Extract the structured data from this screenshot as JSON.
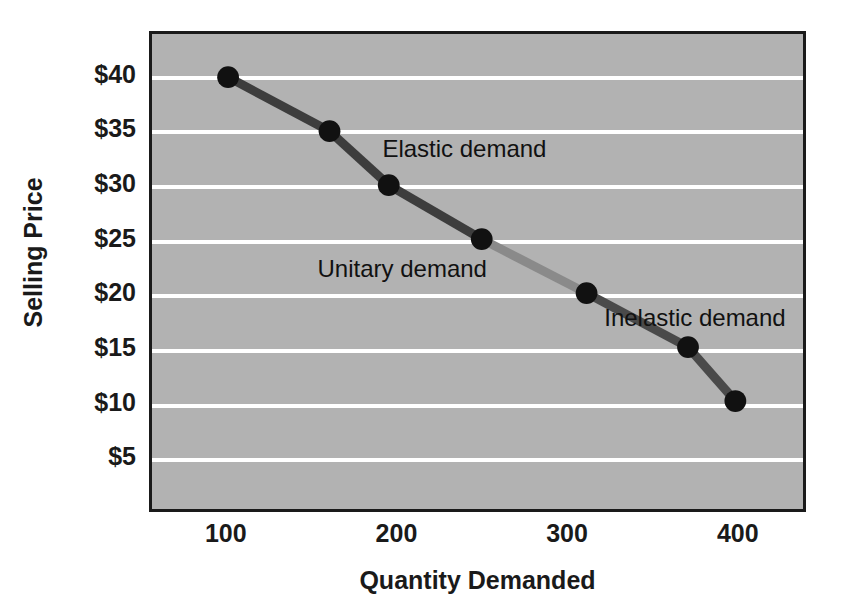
{
  "chart_data": {
    "type": "line",
    "title": "",
    "subtitle": "",
    "xlabel": "Quantity Demanded",
    "ylabel": "Selling Price",
    "xlim": [
      55,
      440
    ],
    "ylim": [
      0,
      44
    ],
    "grid": "horizontal",
    "legend": "none",
    "x_ticks": [
      {
        "value": 100,
        "label": "100"
      },
      {
        "value": 200,
        "label": "200"
      },
      {
        "value": 300,
        "label": "300"
      },
      {
        "value": 400,
        "label": "400"
      }
    ],
    "y_ticks": [
      {
        "value": 40,
        "label": "$40"
      },
      {
        "value": 35,
        "label": "$35"
      },
      {
        "value": 30,
        "label": "$30"
      },
      {
        "value": 25,
        "label": "$25"
      },
      {
        "value": 20,
        "label": "$20"
      },
      {
        "value": 15,
        "label": "$15"
      },
      {
        "value": 10,
        "label": "$10"
      },
      {
        "value": 5,
        "label": "$5"
      }
    ],
    "series": [
      {
        "name": "Demand curve",
        "x": [
          100,
          160,
          195,
          250,
          312,
          372,
          400
        ],
        "y": [
          40,
          35,
          30,
          25,
          20,
          15,
          10
        ],
        "marker": "filled-circle",
        "marker_color": "#111111",
        "marker_size": 11,
        "line_width": 9,
        "segment_colors": [
          "#3d3d3d",
          "#3d3d3d",
          "#3d3d3d",
          "#8a8a8a",
          "#4a4a4a",
          "#4a4a4a"
        ]
      }
    ],
    "annotations": [
      {
        "text": "Elastic demand",
        "x": 190,
        "y": 33.5
      },
      {
        "text": "Unitary demand",
        "x": 152,
        "y": 22.5
      },
      {
        "text": "Inelastic demand",
        "x": 320,
        "y": 18.0
      }
    ],
    "colors": {
      "plot_background": "#b2b2b2",
      "gridline": "#ffffff",
      "border": "#1a1a1a",
      "text": "#1a1a1a",
      "line_dark": "#3d3d3d",
      "line_light": "#8a8a8a",
      "page_background": "#ffffff"
    }
  }
}
